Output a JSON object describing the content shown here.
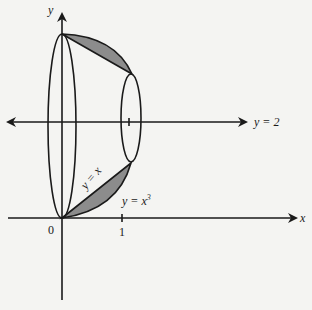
{
  "figure": {
    "axes": {
      "x_label": "x",
      "y_label": "y",
      "origin_label": "0",
      "x_tick_label": "1"
    },
    "axis_of_rotation_label": "y = 2",
    "curves": [
      {
        "name": "line",
        "label": "y = x"
      },
      {
        "name": "cubic",
        "label_base": "y = x",
        "label_exponent": "3"
      }
    ],
    "colors": {
      "stroke": "#1a1a1a",
      "shaded_region": "#8c8c8c",
      "background": "#f4f4f2"
    }
  }
}
